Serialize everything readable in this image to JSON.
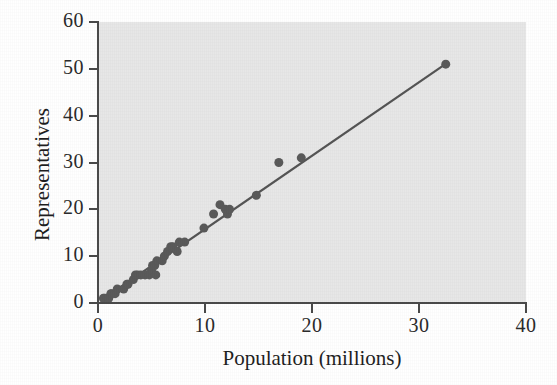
{
  "chart_data": {
    "type": "scatter",
    "title": "",
    "xlabel": "Population (millions)",
    "ylabel": "Representatives",
    "xlim": [
      0,
      40
    ],
    "ylim": [
      0,
      60
    ],
    "xticks": [
      0,
      10,
      20,
      30,
      40
    ],
    "yticks": [
      0,
      10,
      20,
      30,
      40,
      50,
      60
    ],
    "xtick_labels": [
      "0",
      "10",
      "20",
      "30",
      "40"
    ],
    "ytick_labels": [
      "0",
      "10",
      "20",
      "30",
      "40",
      "50",
      "60"
    ],
    "grid": false,
    "legend": null,
    "plot_background": "#e7e7e7",
    "marker_color": "#5a5a5a",
    "line_color": "#555555",
    "axis_color": "#4a4a4a",
    "marker_size_px": 9,
    "series": [
      {
        "name": "States",
        "type": "scatter",
        "points": [
          {
            "x": 0.5,
            "y": 1
          },
          {
            "x": 0.6,
            "y": 1
          },
          {
            "x": 0.8,
            "y": 1
          },
          {
            "x": 0.9,
            "y": 1
          },
          {
            "x": 1.0,
            "y": 1
          },
          {
            "x": 1.2,
            "y": 2
          },
          {
            "x": 1.3,
            "y": 2
          },
          {
            "x": 1.6,
            "y": 2
          },
          {
            "x": 1.8,
            "y": 3
          },
          {
            "x": 2.4,
            "y": 3
          },
          {
            "x": 2.7,
            "y": 4
          },
          {
            "x": 2.8,
            "y": 4
          },
          {
            "x": 3.3,
            "y": 5
          },
          {
            "x": 3.5,
            "y": 6
          },
          {
            "x": 3.7,
            "y": 6
          },
          {
            "x": 4.0,
            "y": 6
          },
          {
            "x": 4.4,
            "y": 6
          },
          {
            "x": 4.8,
            "y": 6
          },
          {
            "x": 5.0,
            "y": 7
          },
          {
            "x": 5.1,
            "y": 8
          },
          {
            "x": 5.3,
            "y": 8
          },
          {
            "x": 5.4,
            "y": 6
          },
          {
            "x": 5.5,
            "y": 9
          },
          {
            "x": 6.0,
            "y": 9
          },
          {
            "x": 6.2,
            "y": 10
          },
          {
            "x": 6.5,
            "y": 11
          },
          {
            "x": 6.8,
            "y": 12
          },
          {
            "x": 7.0,
            "y": 12
          },
          {
            "x": 7.4,
            "y": 11
          },
          {
            "x": 7.6,
            "y": 13
          },
          {
            "x": 8.1,
            "y": 13
          },
          {
            "x": 9.9,
            "y": 16
          },
          {
            "x": 10.8,
            "y": 19
          },
          {
            "x": 11.4,
            "y": 21
          },
          {
            "x": 11.9,
            "y": 20
          },
          {
            "x": 12.1,
            "y": 19
          },
          {
            "x": 12.3,
            "y": 20
          },
          {
            "x": 14.8,
            "y": 23
          },
          {
            "x": 16.9,
            "y": 30
          },
          {
            "x": 19.0,
            "y": 31
          },
          {
            "x": 32.5,
            "y": 51
          }
        ]
      },
      {
        "name": "Regression line",
        "type": "line",
        "points": [
          {
            "x": 0.4,
            "y": 0.7
          },
          {
            "x": 32.6,
            "y": 51.2
          }
        ]
      }
    ]
  }
}
